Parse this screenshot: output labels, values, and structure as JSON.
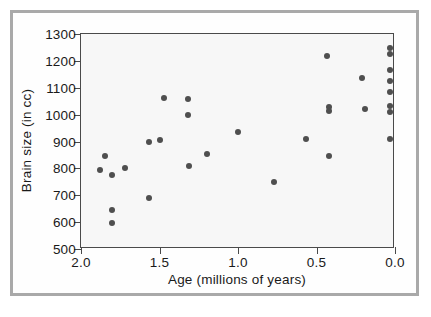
{
  "chart_data": {
    "type": "scatter",
    "title": "",
    "xlabel": "Age (millions of years)",
    "ylabel": "Brain size (in cc)",
    "xlim": [
      2.0,
      0.0
    ],
    "ylim": [
      500,
      1300
    ],
    "x_ticks": [
      "2.0",
      "1.5",
      "1.0",
      "0.5",
      "0.0"
    ],
    "x_tick_values": [
      2.0,
      1.5,
      1.0,
      0.5,
      0.0
    ],
    "y_ticks": [
      "500",
      "600",
      "700",
      "800",
      "900",
      "1000",
      "1100",
      "1200",
      "1300"
    ],
    "y_tick_values": [
      500,
      600,
      700,
      800,
      900,
      1000,
      1100,
      1200,
      1300
    ],
    "x_axis_reversed": true,
    "grid": false,
    "legend": null,
    "marker": "filled-circle",
    "marker_color": "#4f4f4f",
    "points": [
      {
        "x": 1.88,
        "y": 795
      },
      {
        "x": 1.85,
        "y": 845
      },
      {
        "x": 1.8,
        "y": 775
      },
      {
        "x": 1.8,
        "y": 645
      },
      {
        "x": 1.8,
        "y": 595
      },
      {
        "x": 1.72,
        "y": 800
      },
      {
        "x": 1.57,
        "y": 690
      },
      {
        "x": 1.57,
        "y": 897
      },
      {
        "x": 1.5,
        "y": 905
      },
      {
        "x": 1.47,
        "y": 1063
      },
      {
        "x": 1.32,
        "y": 1060
      },
      {
        "x": 1.32,
        "y": 998
      },
      {
        "x": 1.31,
        "y": 808
      },
      {
        "x": 1.2,
        "y": 852
      },
      {
        "x": 1.0,
        "y": 935
      },
      {
        "x": 0.77,
        "y": 750
      },
      {
        "x": 0.57,
        "y": 910
      },
      {
        "x": 0.43,
        "y": 1220
      },
      {
        "x": 0.42,
        "y": 1028
      },
      {
        "x": 0.42,
        "y": 1012
      },
      {
        "x": 0.42,
        "y": 845
      },
      {
        "x": 0.21,
        "y": 1135
      },
      {
        "x": 0.19,
        "y": 1020
      },
      {
        "x": 0.03,
        "y": 1248
      },
      {
        "x": 0.03,
        "y": 1227
      },
      {
        "x": 0.03,
        "y": 1165
      },
      {
        "x": 0.03,
        "y": 1125
      },
      {
        "x": 0.03,
        "y": 1085
      },
      {
        "x": 0.03,
        "y": 1032
      },
      {
        "x": 0.03,
        "y": 1010
      },
      {
        "x": 0.03,
        "y": 910
      }
    ],
    "colors": {
      "plot_background": "#f7f7f7",
      "axis": "#4a4a4a",
      "outer_frame": "#a9a9a9",
      "text": "#1a1a1a"
    }
  }
}
